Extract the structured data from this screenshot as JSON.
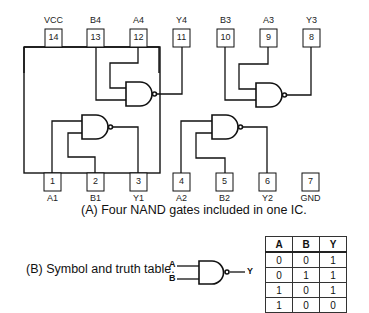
{
  "ic": {
    "top_pins": [
      {
        "num": "14",
        "label": "VCC"
      },
      {
        "num": "13",
        "label": "B4"
      },
      {
        "num": "12",
        "label": "A4"
      },
      {
        "num": "11",
        "label": "Y4"
      },
      {
        "num": "10",
        "label": "B3"
      },
      {
        "num": "9",
        "label": "A3"
      },
      {
        "num": "8",
        "label": "Y3"
      }
    ],
    "bottom_pins": [
      {
        "num": "1",
        "label": "A1"
      },
      {
        "num": "2",
        "label": "B1"
      },
      {
        "num": "3",
        "label": "Y1"
      },
      {
        "num": "4",
        "label": "A2"
      },
      {
        "num": "5",
        "label": "B2"
      },
      {
        "num": "6",
        "label": "Y2"
      },
      {
        "num": "7",
        "label": "GND"
      }
    ],
    "caption": "(A) Four NAND gates included in one IC."
  },
  "symbol": {
    "caption": "(B) Symbol and truth table.",
    "input_a": "A",
    "input_b": "B",
    "output": "Y"
  },
  "truth_table": {
    "headers": [
      "A",
      "B",
      "Y"
    ],
    "rows": [
      [
        "0",
        "0",
        "1"
      ],
      [
        "0",
        "1",
        "1"
      ],
      [
        "1",
        "0",
        "1"
      ],
      [
        "1",
        "0",
        "0"
      ]
    ]
  }
}
